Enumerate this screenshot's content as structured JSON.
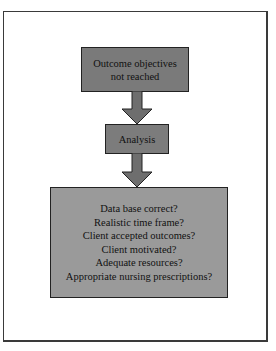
{
  "diagram": {
    "type": "flowchart",
    "nodes": [
      {
        "id": "outcome",
        "lines": [
          "Outcome objectives",
          "not reached"
        ]
      },
      {
        "id": "analysis",
        "lines": [
          "Analysis"
        ]
      },
      {
        "id": "questions",
        "lines": [
          "Data base correct?",
          "Realistic time frame?",
          "Client accepted outcomes?",
          "Client motivated?",
          "Adequate resources?",
          "Appropriate nursing prescriptions?"
        ]
      }
    ],
    "edges": [
      {
        "from": "outcome",
        "to": "analysis"
      },
      {
        "from": "analysis",
        "to": "questions"
      }
    ],
    "colors": {
      "top_box": "#7a7a7a",
      "mid_box": "#7c7c7c",
      "bottom_box": "#9a9a9a",
      "arrow": "#6e6e6e",
      "border": "#222222"
    }
  }
}
